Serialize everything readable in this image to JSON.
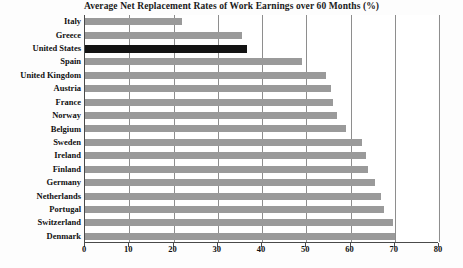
{
  "chart_data": {
    "type": "bar",
    "orientation": "horizontal",
    "title": "Average Net Replacement Rates of Work Earnings over 60 Months (%)",
    "xlabel": "",
    "ylabel": "",
    "xlim": [
      0,
      80
    ],
    "xticks": [
      0,
      10,
      20,
      30,
      40,
      50,
      60,
      70,
      80
    ],
    "grid": "vertical",
    "legend": "none",
    "categories": [
      "Italy",
      "Greece",
      "United States",
      "Spain",
      "United Kingdom",
      "Austria",
      "France",
      "Norway",
      "Belgium",
      "Sweden",
      "Ireland",
      "Finland",
      "Germany",
      "Netherlands",
      "Portugal",
      "Switzerland",
      "Denmark"
    ],
    "values": [
      22,
      35.5,
      36.5,
      49,
      54.5,
      55.5,
      56,
      57,
      59,
      62.5,
      63.5,
      64,
      65.5,
      67,
      67.5,
      69.5,
      70
    ],
    "highlight_category": "United States",
    "colors": {
      "bar": "#9a9a9a",
      "highlight_bar": "#131313",
      "gridline": "#8e8e8e",
      "axis": "#4a4a4a",
      "text": "#111111",
      "background": "#ffffff"
    }
  }
}
